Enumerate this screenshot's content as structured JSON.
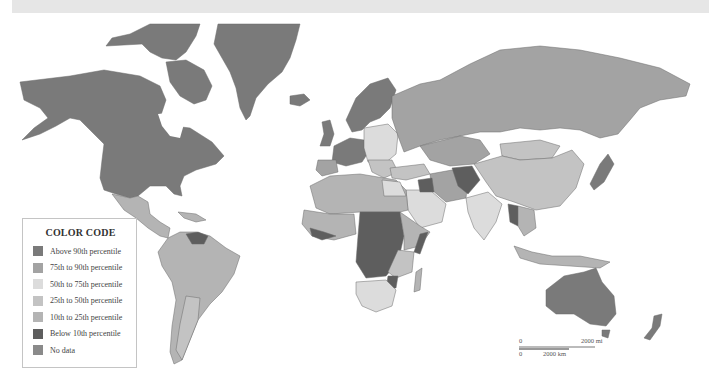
{
  "map": {
    "title": "World choropleth map",
    "colors": {
      "ocean": "#ffffff",
      "above_90": "#7a7a7a",
      "p75_90": "#a3a3a3",
      "p50_75": "#dcdcdc",
      "p25_50": "#c3c3c3",
      "p10_25": "#b4b4b4",
      "below_10": "#5e5e5e",
      "no_data": "#8a8a8a",
      "border": "#6a6a6a"
    }
  },
  "legend": {
    "title": "COLOR CODE",
    "items": [
      {
        "label": "Above 90th percentile",
        "color": "#7a7a7a"
      },
      {
        "label": "75th to 90th percentile",
        "color": "#a3a3a3"
      },
      {
        "label": "50th to 75th percentile",
        "color": "#dcdcdc"
      },
      {
        "label": "25th to 50th percentile",
        "color": "#c3c3c3"
      },
      {
        "label": "10th to 25th percentile",
        "color": "#b4b4b4"
      },
      {
        "label": "Below 10th percentile",
        "color": "#5e5e5e"
      },
      {
        "label": "No data",
        "color": "#8a8a8a"
      }
    ]
  },
  "scale_bar": {
    "top_start": "0",
    "top_end": "2000 mi",
    "bottom_start": "0",
    "bottom_end": "2000 km"
  }
}
